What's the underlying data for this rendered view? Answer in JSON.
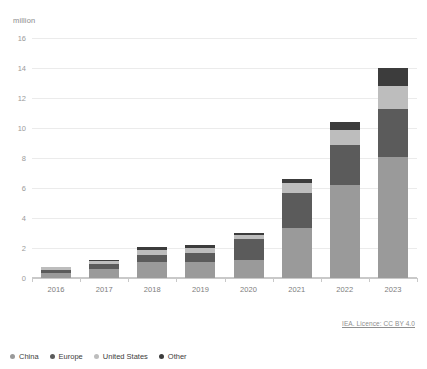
{
  "unit_label": "million",
  "credit": "IEA. Licence: CC BY 4.0",
  "colors": {
    "china": "#9a9a9a",
    "europe": "#5b5b5b",
    "united_states": "#bdbdbd",
    "other": "#3c3c3c",
    "gridline": "#ebebeb",
    "axis": "#c9c9c9",
    "tick_text": "#9a9a9a"
  },
  "legend": {
    "position": "bottom-left",
    "items": [
      {
        "label": "China",
        "color": "#9a9a9a"
      },
      {
        "label": "Europe",
        "color": "#5b5b5b"
      },
      {
        "label": "United States",
        "color": "#bdbdbd"
      },
      {
        "label": "Other",
        "color": "#3c3c3c"
      }
    ]
  },
  "chart_data": {
    "type": "bar",
    "stacked": true,
    "title": "",
    "subtitle": "",
    "xlabel": "",
    "ylabel": "million",
    "ylim": [
      0,
      16
    ],
    "yticks": [
      0,
      2,
      4,
      6,
      8,
      10,
      12,
      14,
      16
    ],
    "ytick_labels": [
      "0",
      "2",
      "4",
      "6",
      "8",
      "10",
      "12",
      "14",
      "16"
    ],
    "grid": true,
    "categories": [
      "2016",
      "2017",
      "2018",
      "2019",
      "2020",
      "2021",
      "2022",
      "2023"
    ],
    "series": [
      {
        "name": "China",
        "color": "#9a9a9a",
        "values": [
          0.33,
          0.6,
          1.1,
          1.1,
          1.2,
          3.35,
          6.2,
          8.1
        ]
      },
      {
        "name": "Europe",
        "color": "#5b5b5b",
        "values": [
          0.22,
          0.32,
          0.42,
          0.6,
          1.4,
          2.35,
          2.7,
          3.2
        ]
      },
      {
        "name": "United States",
        "color": "#bdbdbd",
        "values": [
          0.16,
          0.2,
          0.37,
          0.33,
          0.3,
          0.65,
          1.0,
          1.5
        ]
      },
      {
        "name": "Other",
        "color": "#3c3c3c",
        "values": [
          0.04,
          0.08,
          0.21,
          0.17,
          0.1,
          0.25,
          0.5,
          1.2
        ]
      }
    ],
    "totals": [
      0.75,
      1.2,
      2.1,
      2.2,
      3.0,
      6.6,
      10.4,
      14.0
    ]
  }
}
